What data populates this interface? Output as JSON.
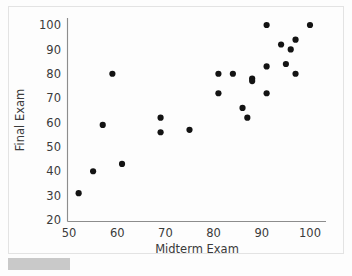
{
  "chart_data": {
    "type": "scatter",
    "title": "",
    "xlabel": "Midterm Exam",
    "ylabel": "Final Exam",
    "xlim": [
      50,
      105
    ],
    "ylim": [
      20,
      103
    ],
    "xticks": [
      50,
      60,
      70,
      80,
      90,
      100
    ],
    "yticks": [
      20,
      30,
      40,
      50,
      60,
      70,
      80,
      90,
      100
    ],
    "grid": false,
    "legend": null,
    "marker": "filled-circle",
    "marker_color": "#131313",
    "n_points": 26,
    "points": [
      {
        "x": 52,
        "y": 31
      },
      {
        "x": 55,
        "y": 40
      },
      {
        "x": 57,
        "y": 59
      },
      {
        "x": 59,
        "y": 80
      },
      {
        "x": 61,
        "y": 43
      },
      {
        "x": 69,
        "y": 56
      },
      {
        "x": 69,
        "y": 62
      },
      {
        "x": 75,
        "y": 57
      },
      {
        "x": 81,
        "y": 72
      },
      {
        "x": 81,
        "y": 80
      },
      {
        "x": 84,
        "y": 80
      },
      {
        "x": 86,
        "y": 66
      },
      {
        "x": 87,
        "y": 62
      },
      {
        "x": 88,
        "y": 78
      },
      {
        "x": 88,
        "y": 77
      },
      {
        "x": 91,
        "y": 72
      },
      {
        "x": 91,
        "y": 83
      },
      {
        "x": 91,
        "y": 100
      },
      {
        "x": 94,
        "y": 92
      },
      {
        "x": 95,
        "y": 84
      },
      {
        "x": 96,
        "y": 90
      },
      {
        "x": 97,
        "y": 94
      },
      {
        "x": 97,
        "y": 80
      },
      {
        "x": 100,
        "y": 100
      }
    ]
  },
  "axes": {
    "x_tick_labels": [
      "50",
      "60",
      "70",
      "80",
      "90",
      "100"
    ],
    "y_tick_labels": [
      "20",
      "30",
      "40",
      "50",
      "60",
      "70",
      "80",
      "90",
      "100"
    ],
    "x_axis_title": "Midterm Exam",
    "y_axis_title": "Final Exam"
  }
}
